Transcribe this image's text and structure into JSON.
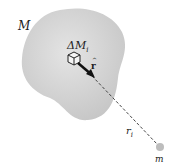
{
  "diagram": {
    "body_label": "M",
    "element_label": "ΔM",
    "element_subscript": "i",
    "unit_vector_label": "r",
    "unit_vector_hat": "^",
    "distance_label": "r",
    "distance_subscript": "i",
    "point_mass_label": "m"
  },
  "colors": {
    "body_fill": "#d2d2d2",
    "line": "#333333",
    "point_mass": "#bdbdbd"
  }
}
